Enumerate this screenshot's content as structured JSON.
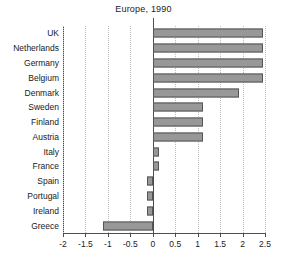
{
  "chart_data": {
    "type": "bar",
    "orientation": "horizontal",
    "title": "Europe, 1990",
    "xlabel": "",
    "ylabel": "",
    "xlim": [
      -2,
      2.5
    ],
    "xticks": [
      -2,
      -1.5,
      -1,
      -0.5,
      0,
      0.5,
      1,
      1.5,
      2,
      2.5
    ],
    "xticklabels": [
      "-2",
      "-1.5",
      "-1",
      "-0.5",
      "0",
      "0.5",
      "1",
      "1.5",
      "2",
      "2.5"
    ],
    "grid": "vertical-dotted",
    "legend": "none",
    "categories": [
      "UK",
      "Netherlands",
      "Germany",
      "Belgium",
      "Denmark",
      "Sweden",
      "Finland",
      "Austria",
      "Italy",
      "France",
      "Spain",
      "Portugal",
      "Ireland",
      "Greece"
    ],
    "values": [
      2.45,
      2.45,
      2.45,
      2.45,
      1.93,
      1.12,
      1.12,
      1.12,
      0.15,
      0.15,
      -0.12,
      -0.13,
      -0.13,
      -1.1
    ],
    "bar_fill_color": "#989898",
    "bar_edge_color": "#555555",
    "gridline_color": "#bdbdbd",
    "axis_color": "#4d4d4d",
    "text_color": "#1a1a1a"
  }
}
